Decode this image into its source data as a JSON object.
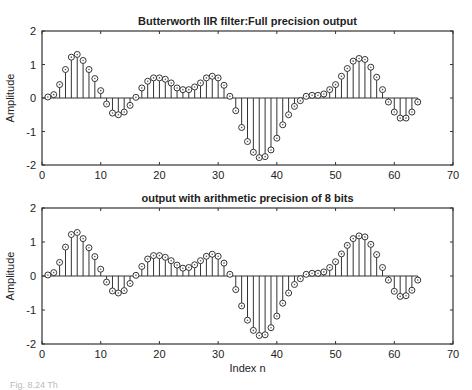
{
  "chart_data": [
    {
      "type": "stem",
      "title": "Butterworth IIR filter:Full precision output",
      "xlabel": "",
      "ylabel": "Amplitude",
      "xlim": [
        0,
        70
      ],
      "ylim": [
        -2,
        2
      ],
      "xticks": [
        0,
        10,
        20,
        30,
        40,
        50,
        60,
        70
      ],
      "yticks": [
        -2,
        -1,
        0,
        1,
        2
      ],
      "grid": false,
      "x": [
        1,
        2,
        3,
        4,
        5,
        6,
        7,
        8,
        9,
        10,
        11,
        12,
        13,
        14,
        15,
        16,
        17,
        18,
        19,
        20,
        21,
        22,
        23,
        24,
        25,
        26,
        27,
        28,
        29,
        30,
        31,
        32,
        33,
        34,
        35,
        36,
        37,
        38,
        39,
        40,
        41,
        42,
        43,
        44,
        45,
        46,
        47,
        48,
        49,
        50,
        51,
        52,
        53,
        54,
        55,
        56,
        57,
        58,
        59,
        60,
        61,
        62,
        63,
        64
      ],
      "values": [
        0.03,
        0.1,
        0.4,
        0.85,
        1.22,
        1.3,
        1.12,
        0.85,
        0.58,
        0.22,
        -0.18,
        -0.45,
        -0.5,
        -0.42,
        -0.22,
        0.02,
        0.3,
        0.5,
        0.6,
        0.6,
        0.56,
        0.45,
        0.3,
        0.25,
        0.25,
        0.33,
        0.45,
        0.6,
        0.65,
        0.6,
        0.38,
        0.05,
        -0.38,
        -0.88,
        -1.3,
        -1.62,
        -1.78,
        -1.75,
        -1.55,
        -1.2,
        -0.8,
        -0.5,
        -0.25,
        -0.08,
        0.05,
        0.08,
        0.08,
        0.12,
        0.25,
        0.4,
        0.65,
        0.88,
        1.1,
        1.18,
        1.15,
        0.92,
        0.62,
        0.25,
        -0.12,
        -0.42,
        -0.6,
        -0.6,
        -0.42,
        -0.12
      ]
    },
    {
      "type": "stem",
      "title": "output with arithmetic precision of 8 bits",
      "xlabel": "Index n",
      "ylabel": "Amplitude",
      "xlim": [
        0,
        70
      ],
      "ylim": [
        -2,
        2
      ],
      "xticks": [
        0,
        10,
        20,
        30,
        40,
        50,
        60,
        70
      ],
      "yticks": [
        -2,
        -1,
        0,
        1,
        2
      ],
      "grid": false,
      "x": [
        1,
        2,
        3,
        4,
        5,
        6,
        7,
        8,
        9,
        10,
        11,
        12,
        13,
        14,
        15,
        16,
        17,
        18,
        19,
        20,
        21,
        22,
        23,
        24,
        25,
        26,
        27,
        28,
        29,
        30,
        31,
        32,
        33,
        34,
        35,
        36,
        37,
        38,
        39,
        40,
        41,
        42,
        43,
        44,
        45,
        46,
        47,
        48,
        49,
        50,
        51,
        52,
        53,
        54,
        55,
        56,
        57,
        58,
        59,
        60,
        61,
        62,
        63,
        64
      ],
      "values": [
        0.03,
        0.1,
        0.4,
        0.85,
        1.22,
        1.28,
        1.1,
        0.83,
        0.57,
        0.2,
        -0.18,
        -0.44,
        -0.5,
        -0.43,
        -0.22,
        0.02,
        0.28,
        0.5,
        0.6,
        0.6,
        0.55,
        0.45,
        0.32,
        0.23,
        0.25,
        0.33,
        0.45,
        0.58,
        0.64,
        0.58,
        0.38,
        0.05,
        -0.4,
        -0.88,
        -1.3,
        -1.6,
        -1.75,
        -1.73,
        -1.52,
        -1.18,
        -0.8,
        -0.5,
        -0.25,
        -0.08,
        0.05,
        0.08,
        0.08,
        0.12,
        0.25,
        0.42,
        0.65,
        0.9,
        1.1,
        1.18,
        1.15,
        0.93,
        0.63,
        0.25,
        -0.12,
        -0.45,
        -0.6,
        -0.58,
        -0.42,
        -0.12
      ]
    }
  ],
  "plots": [
    {
      "title": "Butterworth IIR filter:Full precision output",
      "ylabel": "Amplitude",
      "xlabel": ""
    },
    {
      "title": "output with arithmetic precision of 8 bits",
      "ylabel": "Amplitude",
      "xlabel": "Index n"
    }
  ],
  "caption": "Fig. 8.24  Th"
}
